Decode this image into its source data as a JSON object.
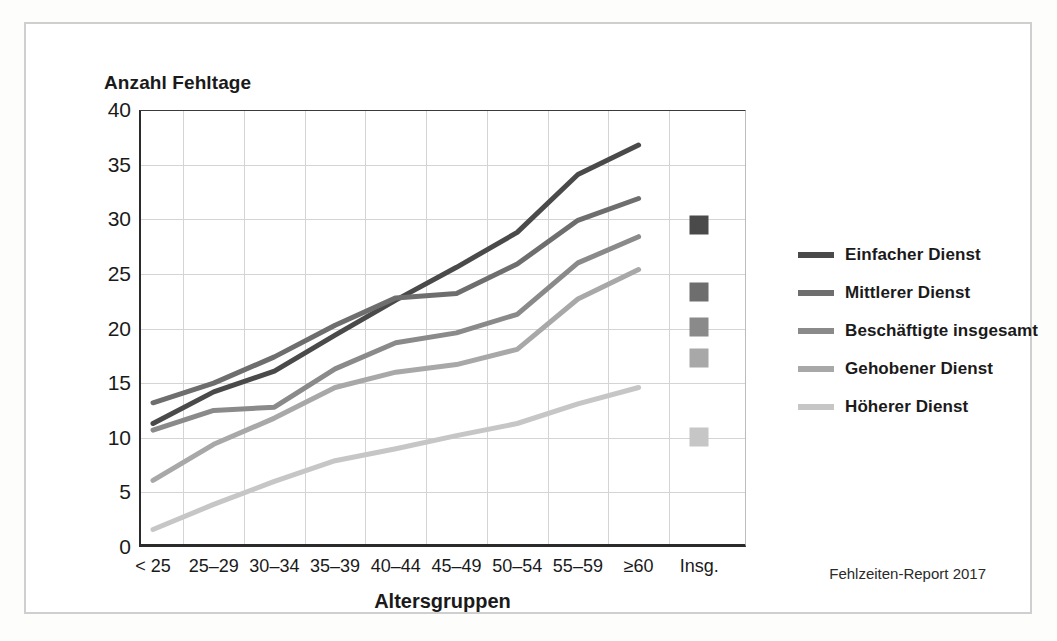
{
  "title": "Anzahl Fehltage",
  "credit": "Fehlzeiten-Report 2017",
  "axis": {
    "x_title": "Altersgruppen",
    "y_ticks": [
      "40",
      "35",
      "30",
      "25",
      "20",
      "15",
      "10",
      "5",
      "0"
    ],
    "x_ticks": [
      "< 25",
      "25–29",
      "30–34",
      "35–39",
      "40–44",
      "45–49",
      "50–54",
      "55–59",
      "≥60",
      "Insg."
    ]
  },
  "legend": {
    "items": [
      {
        "label": "Einfacher Dienst",
        "color": "#4a4a4a"
      },
      {
        "label": "Mittlerer Dienst",
        "color": "#6e6e6e"
      },
      {
        "label": "Beschäftigte insgesamt",
        "color": "#8a8a8a"
      },
      {
        "label": "Gehobener Dienst",
        "color": "#a8a8a8"
      },
      {
        "label": "Höherer Dienst",
        "color": "#c6c6c6"
      }
    ]
  },
  "chart_data": {
    "type": "line",
    "title": "Anzahl Fehltage",
    "xlabel": "Altersgruppen",
    "ylabel": "Anzahl Fehltage",
    "ylim": [
      0,
      40
    ],
    "ytick_step": 5,
    "grid": true,
    "legend_position": "right",
    "categories": [
      "< 25",
      "25–29",
      "30–34",
      "35–39",
      "40–44",
      "45–49",
      "50–54",
      "55–59",
      "≥60"
    ],
    "total_category": "Insg.",
    "series": [
      {
        "name": "Einfacher Dienst",
        "color": "#4a4a4a",
        "values": [
          11.3,
          14.2,
          16.1,
          19.4,
          22.6,
          25.6,
          28.8,
          34.1,
          36.8
        ],
        "total": 29.5
      },
      {
        "name": "Mittlerer Dienst",
        "color": "#6e6e6e",
        "values": [
          13.2,
          15.0,
          17.4,
          20.3,
          22.8,
          23.2,
          25.9,
          29.9,
          31.9
        ],
        "total": 23.3
      },
      {
        "name": "Beschäftigte insgesamt",
        "color": "#8a8a8a",
        "values": [
          10.7,
          12.5,
          12.8,
          16.3,
          18.7,
          19.6,
          21.3,
          26.0,
          28.4
        ],
        "total": 20.1
      },
      {
        "name": "Gehobener Dienst",
        "color": "#a8a8a8",
        "values": [
          6.1,
          9.4,
          11.8,
          14.6,
          16.0,
          16.7,
          18.1,
          22.7,
          25.4
        ],
        "total": 17.3
      },
      {
        "name": "Höherer Dienst",
        "color": "#c6c6c6",
        "values": [
          1.6,
          3.9,
          6.0,
          7.9,
          9.0,
          10.2,
          11.3,
          13.1,
          14.6
        ],
        "total": 10.1
      }
    ]
  }
}
